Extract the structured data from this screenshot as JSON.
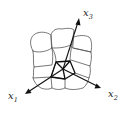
{
  "figure": {
    "background": "#ffffff",
    "line_color": "#555555",
    "axis_color": "#111111"
  },
  "axes": [
    {
      "id": "x1",
      "label": "x",
      "subscript": "1"
    },
    {
      "id": "x2",
      "label": "x",
      "subscript": "2"
    },
    {
      "id": "x3",
      "label": "x",
      "subscript": "3"
    }
  ]
}
